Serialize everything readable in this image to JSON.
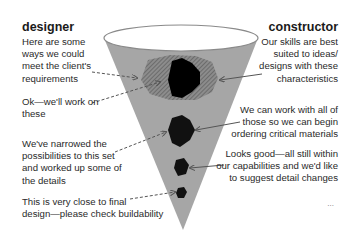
{
  "left_column": {
    "heading": "designer",
    "notes": [
      {
        "lines": [
          "Here are some",
          "ways we could",
          "meet the client's",
          "requirements"
        ]
      },
      {
        "lines": [
          "Ok—we'll work on",
          "these"
        ]
      },
      {
        "lines": [
          "We've narrowed the",
          "possibilities to this set",
          "and worked up some of",
          "the details"
        ]
      },
      {
        "lines": [
          "This is very close to final",
          "design—please check buildability"
        ]
      }
    ]
  },
  "right_column": {
    "heading": "constructor",
    "notes": [
      {
        "lines": [
          "Our skills are best",
          "suited to ideas/",
          "designs with these",
          "characteristics"
        ]
      },
      {
        "lines": [
          "We can work with all of",
          "those so we can begin",
          "ordering critical materials"
        ]
      },
      {
        "lines": [
          "Looks good—all still within",
          "our capabilities and we'd like",
          "to suggest detail changes"
        ]
      },
      {
        "lines": [
          "..."
        ]
      }
    ]
  },
  "diagram": {
    "shape": "funnel",
    "colors": {
      "funnel_fill": "#a6a6a6",
      "funnel_rim": "#ffffff",
      "hatched_region": "#7a7a7a",
      "solid_shape": "#000000",
      "arrow": "#555555"
    },
    "stages": [
      "wide-options",
      "narrowed-set",
      "detailed",
      "final-design"
    ]
  }
}
